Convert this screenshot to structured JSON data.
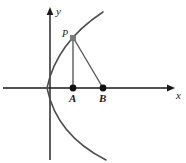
{
  "figure": {
    "kind": "coordinate-geometry-diagram",
    "background_color": "#ffffff",
    "width": 186,
    "height": 163,
    "axes": {
      "x_axis": {
        "label": "x",
        "label_x": 176,
        "label_y": 90,
        "start_x": 3,
        "end_x": 175,
        "y": 88,
        "arrow": "right",
        "color": "#1a1a1a"
      },
      "y_axis": {
        "label": "y",
        "label_x": 56,
        "label_y": 6,
        "x": 50,
        "start_y": 8,
        "end_y": 160,
        "arrow": "up",
        "color": "#1a1a1a"
      },
      "origin": {
        "x": 50,
        "y": 88
      }
    },
    "curve": {
      "name": "parabola",
      "opens": "right",
      "color": "#4d4d4d",
      "stroke_width": 1.5,
      "vertex": {
        "x": 47,
        "y": 88
      },
      "upper_end": {
        "x": 103,
        "y": 12
      },
      "lower_end": {
        "x": 106,
        "y": 160
      },
      "path": "M 103 12 Q 56.5 42.5 47 88 Q 56.5 135 106 160"
    },
    "points": [
      {
        "label": "P",
        "marker": "square",
        "color": "#7a7a7a",
        "x": 73,
        "y": 38,
        "size": 5,
        "label_x": 62,
        "label_y": 29
      },
      {
        "label": "A",
        "marker": "dot",
        "color": "#111111",
        "x": 73,
        "y": 88,
        "radius": 3.4,
        "label_x": 69,
        "label_y": 93
      },
      {
        "label": "B",
        "marker": "dot",
        "color": "#111111",
        "x": 103,
        "y": 88,
        "radius": 3.4,
        "label_x": 99,
        "label_y": 93
      }
    ],
    "segments": [
      {
        "name": "PA",
        "from": "P",
        "to": "A",
        "x1": 73,
        "y1": 38,
        "x2": 73,
        "y2": 88,
        "color": "#5a5a5a"
      },
      {
        "name": "PB",
        "from": "P",
        "to": "B",
        "x1": 73,
        "y1": 38,
        "x2": 103,
        "y2": 88,
        "color": "#5a5a5a"
      }
    ]
  }
}
